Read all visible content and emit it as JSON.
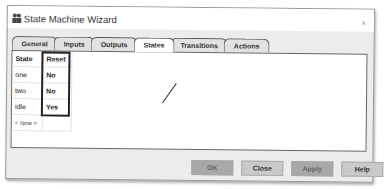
{
  "window": {
    "title": "State Machine Wizard",
    "close_glyph": "×",
    "icon": "people-icon"
  },
  "tabs": [
    {
      "label": "General"
    },
    {
      "label": "Inputs"
    },
    {
      "label": "Outputs"
    },
    {
      "label": "States",
      "active": true
    },
    {
      "label": "Transitions"
    },
    {
      "label": "Actions"
    }
  ],
  "table": {
    "headers": [
      "State",
      "Reset"
    ],
    "rows": [
      [
        "one",
        "No"
      ],
      [
        "two",
        "No"
      ],
      [
        "idle",
        "Yes"
      ]
    ],
    "new_row_label": "< New >"
  },
  "buttons": {
    "ok": "OK",
    "close": "Close",
    "apply": "Apply",
    "help": "Help"
  }
}
